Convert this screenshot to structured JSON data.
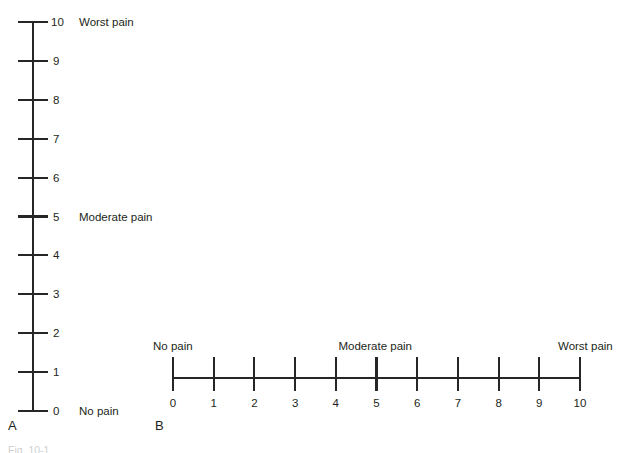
{
  "figure": {
    "ink_color": "#262626",
    "text_color": "#231f20",
    "background": "#ffffff",
    "caption_fragment": "Fig. 10-1"
  },
  "panel_a": {
    "letter": "A",
    "orientation": "vertical",
    "ticks": [
      {
        "value": "10",
        "anchor": "Worst pain"
      },
      {
        "value": "9",
        "anchor": ""
      },
      {
        "value": "8",
        "anchor": ""
      },
      {
        "value": "7",
        "anchor": ""
      },
      {
        "value": "6",
        "anchor": ""
      },
      {
        "value": "5",
        "anchor": "Moderate pain"
      },
      {
        "value": "4",
        "anchor": ""
      },
      {
        "value": "3",
        "anchor": ""
      },
      {
        "value": "2",
        "anchor": ""
      },
      {
        "value": "1",
        "anchor": ""
      },
      {
        "value": "0",
        "anchor": "No pain"
      }
    ]
  },
  "panel_b": {
    "letter": "B",
    "orientation": "horizontal",
    "ticks": [
      {
        "value": "0"
      },
      {
        "value": "1"
      },
      {
        "value": "2"
      },
      {
        "value": "3"
      },
      {
        "value": "4"
      },
      {
        "value": "5"
      },
      {
        "value": "6"
      },
      {
        "value": "7"
      },
      {
        "value": "8"
      },
      {
        "value": "9"
      },
      {
        "value": "10"
      }
    ],
    "anchors": [
      {
        "label": "No pain",
        "align": "left"
      },
      {
        "label": "Moderate pain",
        "align": "center"
      },
      {
        "label": "Worst pain",
        "align": "right"
      }
    ]
  },
  "chart_data": {
    "type": "scale",
    "title": "",
    "panels": [
      {
        "id": "A",
        "type": "vertical-numeric-rating-scale",
        "axis": "vertical",
        "min": 0,
        "max": 10,
        "step": 1,
        "tick_labels": [
          "0",
          "1",
          "2",
          "3",
          "4",
          "5",
          "6",
          "7",
          "8",
          "9",
          "10"
        ],
        "anchor_points": [
          {
            "value": 0,
            "label": "No pain"
          },
          {
            "value": 5,
            "label": "Moderate pain"
          },
          {
            "value": 10,
            "label": "Worst pain"
          }
        ]
      },
      {
        "id": "B",
        "type": "horizontal-numeric-rating-scale",
        "axis": "horizontal",
        "min": 0,
        "max": 10,
        "step": 1,
        "tick_labels": [
          "0",
          "1",
          "2",
          "3",
          "4",
          "5",
          "6",
          "7",
          "8",
          "9",
          "10"
        ],
        "anchor_points": [
          {
            "value": 0,
            "label": "No pain"
          },
          {
            "value": 5,
            "label": "Moderate pain"
          },
          {
            "value": 10,
            "label": "Worst pain"
          }
        ]
      }
    ],
    "xlabel": "",
    "ylabel": "",
    "grid": false,
    "legend": null
  }
}
